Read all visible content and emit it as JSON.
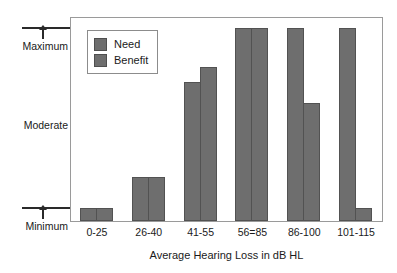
{
  "chart_data": {
    "type": "bar",
    "title": "",
    "xlabel": "Average Hearing Loss in dB HL",
    "ylabel": "",
    "categories": [
      "0-25",
      "26-40",
      "41-55",
      "56=85",
      "86-100",
      "101-115"
    ],
    "series": [
      {
        "name": "Need",
        "values": [
          7,
          23,
          72,
          100,
          100,
          100
        ]
      },
      {
        "name": "Benefit",
        "values": [
          7,
          23,
          80,
          100,
          61,
          7
        ]
      }
    ],
    "ylim": [
      0,
      100
    ],
    "y_tick_labels": [
      "Maximum",
      "Moderate",
      "Minimum"
    ],
    "y_scale_note": "Ordinal scale: Minimum at bottom, Moderate at middle, Maximum at top",
    "grid": false,
    "legend_position": "top-left",
    "bar_color": "#6e6e6e",
    "bar_border_color": "#525252"
  },
  "axes": {
    "y": {
      "maximum_label": "Maximum",
      "moderate_label": "Moderate",
      "minimum_label": "Minimum"
    },
    "x": {
      "title": "Average Hearing Loss in dB HL",
      "ticks": [
        "0-25",
        "26-40",
        "41-55",
        "56=85",
        "86-100",
        "101-115"
      ]
    }
  },
  "legend": {
    "items": [
      {
        "label": "Need"
      },
      {
        "label": "Benefit"
      }
    ]
  }
}
